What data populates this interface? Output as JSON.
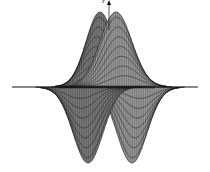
{
  "figure": {
    "type": "3d-surface",
    "axis_label_z": "z",
    "colors": {
      "surface_fill": "#9a9a9a",
      "surface_fill_dark": "#7a7a7a",
      "mesh_line": "#1a1a1a",
      "axis": "#111111",
      "background": "#ffffff"
    }
  },
  "chart_data": {
    "type": "surface",
    "title": "",
    "xlabel": "",
    "ylabel": "",
    "zlabel": "z",
    "lobes": [
      {
        "sign": "positive",
        "position": "upper-left",
        "peak_px": [
          100,
          12
        ]
      },
      {
        "sign": "positive",
        "position": "upper-right",
        "peak_px": [
          116,
          12
        ]
      },
      {
        "sign": "negative",
        "position": "lower-left",
        "trough_px": [
          88,
          163
        ]
      },
      {
        "sign": "negative",
        "position": "lower-right",
        "trough_px": [
          132,
          163
        ]
      }
    ],
    "baseline_y_px": 87,
    "x_extent_px": [
      12,
      198
    ],
    "grid": false,
    "legend": false
  }
}
